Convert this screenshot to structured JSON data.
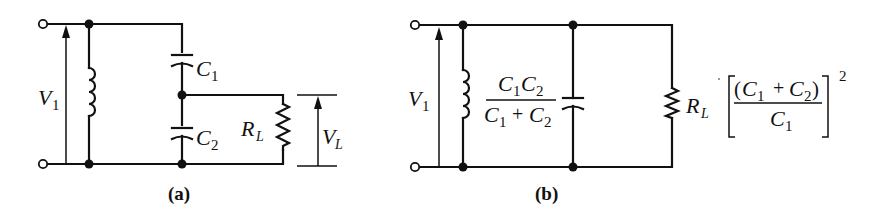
{
  "figure": {
    "panel_a": {
      "caption": "(a)",
      "labels": {
        "v1": "V",
        "v1_sub": "1",
        "c1": "C",
        "c1_sub": "1",
        "c2": "C",
        "c2_sub": "2",
        "rl": "R",
        "rl_sub": "L",
        "vl": "V",
        "vl_sub": "L"
      }
    },
    "panel_b": {
      "caption": "(b)",
      "labels": {
        "v1": "V",
        "v1_sub": "1",
        "cap_num_c1": "C",
        "cap_num_c1_sub": "1",
        "cap_num_c2": "C",
        "cap_num_c2_sub": "2",
        "cap_den_c1": "C",
        "cap_den_c1_sub": "1",
        "cap_den_plus": "+",
        "cap_den_c2": "C",
        "cap_den_c2_sub": "2",
        "rl": "R",
        "rl_sub": "L",
        "factor_open": "(",
        "factor_c1": "C",
        "factor_c1_sub": "1",
        "factor_plus": "+",
        "factor_c2": "C",
        "factor_c2_sub": "2",
        "factor_close": ")",
        "factor_den": "C",
        "factor_den_sub": "1",
        "factor_exp": "2"
      }
    }
  }
}
